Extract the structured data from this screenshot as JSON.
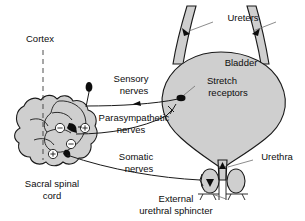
{
  "figure": {
    "colors": {
      "organ_fill": "#cfcfcf",
      "outline": "#1a1a1a",
      "leader": "#6e6e6e",
      "background": "#ffffff",
      "marker_black": "#0d0d0d"
    }
  },
  "labels": {
    "ureters": "Ureters",
    "bladder": "Bladder",
    "stretch_receptors_line1": "Stretch",
    "stretch_receptors_line2": "receptors",
    "urethra": "Urethra",
    "cortex": "Cortex",
    "sensory_line1": "Sensory",
    "sensory_line2": "nerves",
    "parasympathetic_line1": "Parasympathetic",
    "parasympathetic_line2": "nerves",
    "somatic_line1": "Somatic",
    "somatic_line2": "nerves",
    "sacral_line1": "Sacral spinal",
    "sacral_line2": "cord",
    "sphincter_line1": "External",
    "sphincter_line2": "urethral sphincter"
  },
  "symbols": {
    "inhibitory": "⊖",
    "excitatory": "⊕"
  },
  "synapse_markers": [
    {
      "id": "upper-inhibitory",
      "sign": "minus"
    },
    {
      "id": "upper-excitatory",
      "sign": "plus"
    },
    {
      "id": "lower-inhibitory",
      "sign": "minus"
    },
    {
      "id": "lower-excitatory",
      "sign": "plus"
    }
  ]
}
